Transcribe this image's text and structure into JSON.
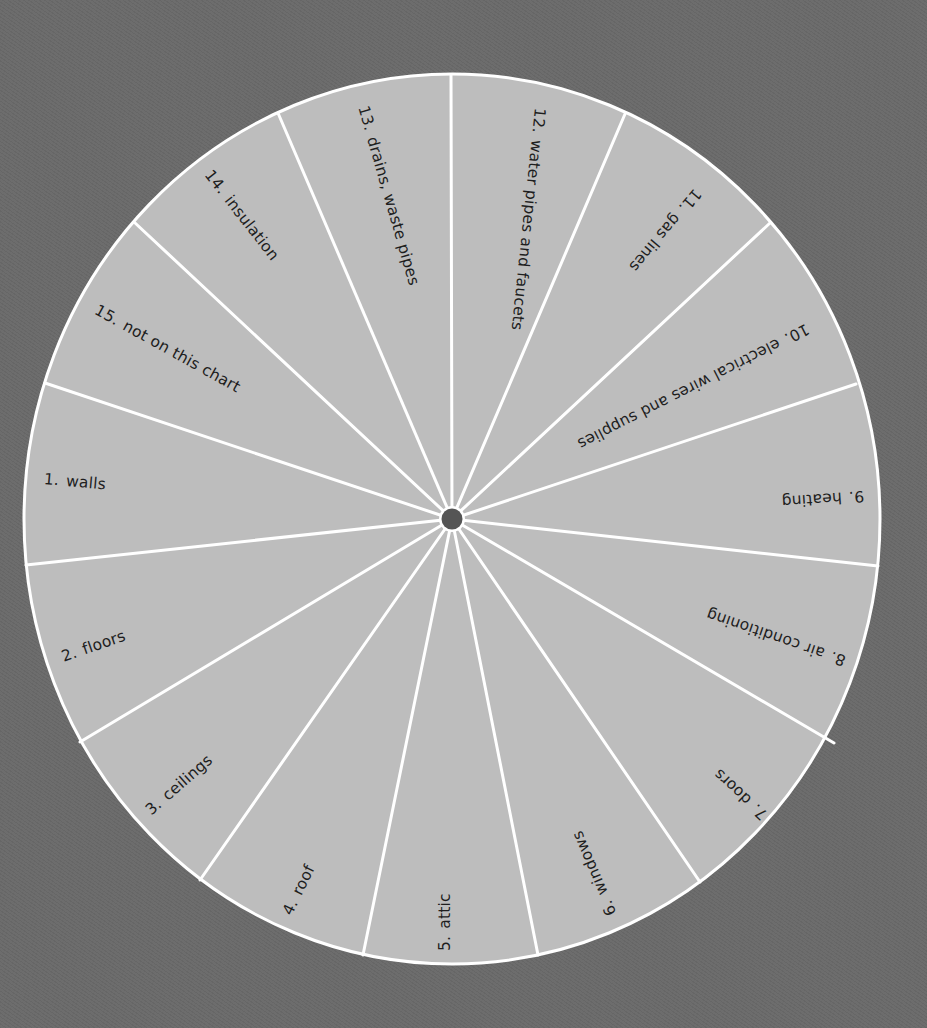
{
  "diagram": {
    "type": "wheel",
    "segment_count": 15,
    "colors": {
      "background": "#6a6a6a",
      "segment_fill": "#bdbdbd",
      "divider": "#ffffff",
      "hub": "#555555",
      "text": "#1e1e1e"
    },
    "segments": [
      {
        "number": "1.",
        "label": "walls"
      },
      {
        "number": "2.",
        "label": "floors"
      },
      {
        "number": "3.",
        "label": "ceilings"
      },
      {
        "number": "4.",
        "label": "roof"
      },
      {
        "number": "5.",
        "label": "attic"
      },
      {
        "number": "6.",
        "label": "windows"
      },
      {
        "number": "7.",
        "label": "doors"
      },
      {
        "number": "8.",
        "label": "air conditioning"
      },
      {
        "number": "9.",
        "label": "heating"
      },
      {
        "number": "10.",
        "label": "electrical wires and supplies"
      },
      {
        "number": "11.",
        "label": "gas lines"
      },
      {
        "number": "12.",
        "label": "water pipes and faucets"
      },
      {
        "number": "13.",
        "label": "drains, waste pipes"
      },
      {
        "number": "14.",
        "label": "insulation"
      },
      {
        "number": "15.",
        "label": "not on this chart"
      }
    ]
  }
}
